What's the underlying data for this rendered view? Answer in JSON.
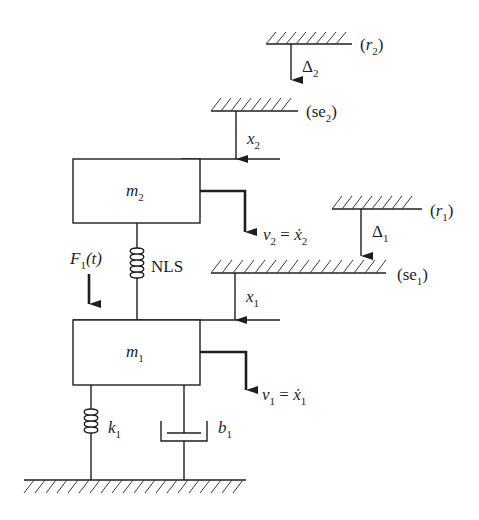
{
  "diagram": {
    "title": "",
    "masses": [
      {
        "id": "m2",
        "symbol": "m",
        "subscript": "2"
      },
      {
        "id": "m1",
        "symbol": "m",
        "subscript": "1"
      }
    ],
    "references": [
      {
        "id": "r2",
        "label_open": "(",
        "symbol": "r",
        "subscript": "2",
        "label_close": ")"
      },
      {
        "id": "se2",
        "label_open": "(",
        "symbol": "se",
        "subscript": "2",
        "label_close": ")"
      },
      {
        "id": "r1",
        "label_open": "(",
        "symbol": "r",
        "subscript": "1",
        "label_close": ")"
      },
      {
        "id": "se1",
        "label_open": "(",
        "symbol": "se",
        "subscript": "1",
        "label_close": ")"
      }
    ],
    "displacements": [
      {
        "id": "delta2",
        "symbol": "Δ",
        "subscript": "2"
      },
      {
        "id": "x2",
        "symbol": "x",
        "subscript": "2"
      },
      {
        "id": "delta1",
        "symbol": "Δ",
        "subscript": "1"
      },
      {
        "id": "x1",
        "symbol": "x",
        "subscript": "1"
      }
    ],
    "velocities": [
      {
        "id": "v2",
        "symbol": "v",
        "subscript": "2",
        "equals": " = ",
        "rhs": "ẋ",
        "rhs_subscript": "2"
      },
      {
        "id": "v1",
        "symbol": "v",
        "subscript": "1",
        "equals": " = ",
        "rhs": "ẋ",
        "rhs_subscript": "1"
      }
    ],
    "force": {
      "symbol": "F",
      "subscript": "1",
      "arg": "(t)"
    },
    "elements": {
      "nonlinear_spring": {
        "label": "NLS"
      },
      "spring": {
        "symbol": "k",
        "subscript": "1"
      },
      "damper": {
        "symbol": "b",
        "subscript": "1"
      }
    }
  }
}
